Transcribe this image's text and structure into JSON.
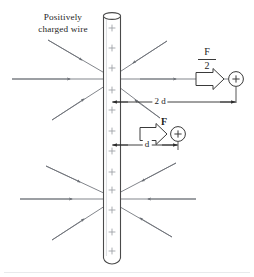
{
  "figure": {
    "type": "physics-diagram",
    "wire_label_line1": "Positively",
    "wire_label_line2": "charged wire",
    "wire_charge_symbol": "+",
    "wire_charge_count": 12,
    "charges": [
      {
        "id": "far-charge",
        "symbol": "+",
        "force_label_numerator": "F",
        "force_label_denominator": "2",
        "force_label_text": "F/2",
        "distance_label": "2 d",
        "distance_multiplier": 2
      },
      {
        "id": "near-charge",
        "symbol": "+",
        "force_label_numerator": "F",
        "force_label_denominator": "",
        "force_label_text": "F",
        "distance_label": "d",
        "distance_multiplier": 1
      }
    ],
    "field_lines": {
      "direction": "inward-toward-wire",
      "clusters": 2,
      "rays_per_cluster": 8
    },
    "colors": {
      "line": "#6b6f76",
      "ink": "#2b2b2b",
      "wire_outline": "#4a4a4a",
      "wire_fill": "#ffffff",
      "charge_mark": "#8a8d93",
      "dim_line": "#2b2b2b",
      "background": "#ffffff"
    }
  }
}
